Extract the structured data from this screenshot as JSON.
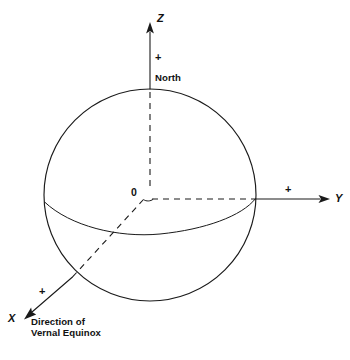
{
  "diagram": {
    "background_color": "#ffffff",
    "line_color": "#1a1a1a",
    "axes": [
      {
        "id": "z",
        "label": "Z",
        "sign_label": "+",
        "direction": "up",
        "endpoint_label": "North"
      },
      {
        "id": "y",
        "label": "Y",
        "sign_label": "+",
        "direction": "right"
      },
      {
        "id": "x",
        "label": "X",
        "sign_label": "+",
        "direction": "down-left",
        "caption_line1": "Direction of",
        "caption_line2": "Vernal Equinox"
      }
    ],
    "origin": {
      "label": "0"
    },
    "sphere": {
      "name": "celestial-sphere",
      "equator_name": "equator-arc"
    }
  }
}
